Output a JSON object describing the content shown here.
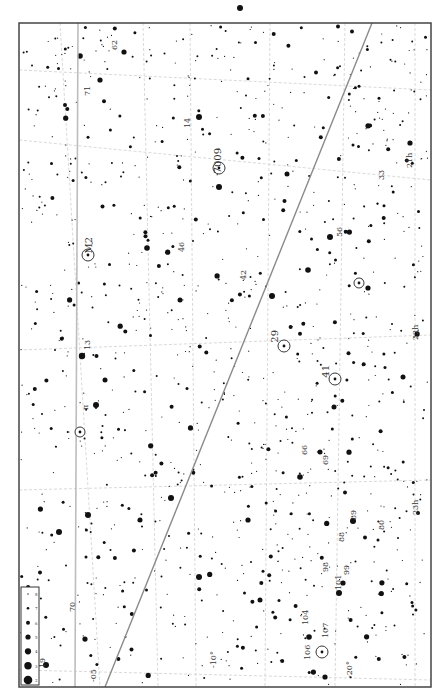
{
  "chart": {
    "frame": {
      "x": 19,
      "y": 23,
      "w": 412,
      "h": 664,
      "stroke": "#444"
    },
    "background": "#ffffff",
    "star_color": "#111111",
    "grid_color": "#cfcfcf",
    "line_color": "#8a8a8a",
    "label_color": "#444444",
    "star_seed": 7,
    "star_count": 1100
  },
  "legend": {
    "box": {
      "x": 21,
      "y": 587,
      "w": 18,
      "h": 98
    },
    "magnitudes": [
      {
        "r": 0.7,
        "label": "8"
      },
      {
        "r": 1.3,
        "label": "7"
      },
      {
        "r": 2.0,
        "label": "6"
      },
      {
        "r": 2.6,
        "label": "5"
      },
      {
        "r": 3.1,
        "label": "4"
      },
      {
        "r": 3.7,
        "label": "3"
      },
      {
        "r": 4.3,
        "label": "2"
      }
    ]
  },
  "grid": {
    "ra_lines": [
      {
        "x1": 60,
        "y1": 23,
        "x2": 100,
        "y2": 687
      },
      {
        "x1": 143,
        "y1": 23,
        "x2": 158,
        "y2": 687
      },
      {
        "x1": 190,
        "y1": 23,
        "x2": 196,
        "y2": 687
      },
      {
        "x1": 270,
        "y1": 23,
        "x2": 265,
        "y2": 687
      },
      {
        "x1": 345,
        "y1": 23,
        "x2": 335,
        "y2": 687
      },
      {
        "x1": 415,
        "y1": 23,
        "x2": 415,
        "y2": 687
      }
    ],
    "dec_lines": [
      {
        "x1": 19,
        "y1": 70,
        "x2": 431,
        "y2": 90
      },
      {
        "x1": 19,
        "y1": 140,
        "x2": 431,
        "y2": 180
      },
      {
        "x1": 19,
        "y1": 350,
        "x2": 431,
        "y2": 335
      },
      {
        "x1": 19,
        "y1": 490,
        "x2": 431,
        "y2": 480
      },
      {
        "x1": 19,
        "y1": 670,
        "x2": 431,
        "y2": 680
      }
    ]
  },
  "lines": {
    "ecliptic": {
      "x1": 105,
      "y1": 687,
      "x2": 372,
      "y2": 23
    },
    "celestial_equator": {
      "x1": 78,
      "y1": 23,
      "x2": 75,
      "y2": 687
    }
  },
  "deep_sky": [
    {
      "name": "M2",
      "x": 88,
      "y": 255,
      "r": 6,
      "label_dx": 4,
      "label_dy": -18
    },
    {
      "name": "7009",
      "x": 219,
      "y": 168,
      "r": 6,
      "label_dx": 2,
      "label_dy": -20
    },
    {
      "name": "29",
      "x": 284,
      "y": 346,
      "r": 6,
      "label_dx": -6,
      "label_dy": -16
    },
    {
      "name": "41",
      "x": 335,
      "y": 379,
      "r": 6,
      "label_dx": -6,
      "label_dy": -14
    },
    {
      "name": "",
      "x": 80,
      "y": 432,
      "r": 5,
      "label_dx": 0,
      "label_dy": 0
    },
    {
      "name": "",
      "x": 322,
      "y": 652,
      "r": 6,
      "label_dx": 0,
      "label_dy": 0
    },
    {
      "name": "",
      "x": 359,
      "y": 283,
      "r": 5,
      "label_dx": 0,
      "label_dy": 0
    }
  ],
  "labels": [
    {
      "text": "19",
      "x": 45,
      "y": 668
    },
    {
      "text": "-05",
      "x": 96,
      "y": 682
    },
    {
      "text": "-10°",
      "x": 216,
      "y": 668
    },
    {
      "text": "-20°",
      "x": 352,
      "y": 678
    },
    {
      "text": "107",
      "x": 328,
      "y": 638
    },
    {
      "text": "106",
      "x": 310,
      "y": 660
    },
    {
      "text": "104",
      "x": 308,
      "y": 625
    },
    {
      "text": "101",
      "x": 341,
      "y": 590
    },
    {
      "text": "99",
      "x": 349,
      "y": 575
    },
    {
      "text": "98",
      "x": 328,
      "y": 572
    },
    {
      "text": "88",
      "x": 344,
      "y": 542
    },
    {
      "text": "89",
      "x": 356,
      "y": 520
    },
    {
      "text": "69",
      "x": 328,
      "y": 465
    },
    {
      "text": "66",
      "x": 307,
      "y": 455
    },
    {
      "text": "80",
      "x": 384,
      "y": 530
    },
    {
      "text": "23h",
      "x": 418,
      "y": 515
    },
    {
      "text": "22h",
      "x": 418,
      "y": 340
    },
    {
      "text": "21h",
      "x": 412,
      "y": 168
    },
    {
      "text": "56",
      "x": 342,
      "y": 237
    },
    {
      "text": "33",
      "x": 384,
      "y": 180
    },
    {
      "text": "42",
      "x": 246,
      "y": 280
    },
    {
      "text": "46",
      "x": 184,
      "y": 252
    },
    {
      "text": "14",
      "x": 190,
      "y": 128
    },
    {
      "text": "62",
      "x": 117,
      "y": 50
    },
    {
      "text": "71",
      "x": 90,
      "y": 96
    },
    {
      "text": "13",
      "x": 90,
      "y": 350
    },
    {
      "text": "π",
      "x": 88,
      "y": 410
    },
    {
      "text": "70",
      "x": 75,
      "y": 612
    }
  ],
  "bright_stars": [
    {
      "x": 80,
      "y": 432,
      "r": 3.5
    },
    {
      "x": 96,
      "y": 405,
      "r": 3
    },
    {
      "x": 105,
      "y": 380,
      "r": 2.5
    },
    {
      "x": 82,
      "y": 356,
      "r": 3.2
    },
    {
      "x": 147,
      "y": 248,
      "r": 2.8
    },
    {
      "x": 272,
      "y": 296,
      "r": 3
    },
    {
      "x": 219,
      "y": 187,
      "r": 3
    },
    {
      "x": 240,
      "y": 8,
      "r": 3
    },
    {
      "x": 335,
      "y": 379,
      "r": 3
    },
    {
      "x": 308,
      "y": 270,
      "r": 2.8
    },
    {
      "x": 330,
      "y": 237,
      "r": 3
    },
    {
      "x": 171,
      "y": 498,
      "r": 3
    },
    {
      "x": 199,
      "y": 577,
      "r": 3
    },
    {
      "x": 88,
      "y": 515,
      "r": 3
    },
    {
      "x": 59,
      "y": 532,
      "r": 3
    },
    {
      "x": 100,
      "y": 80,
      "r": 2.6
    },
    {
      "x": 80,
      "y": 56,
      "r": 2.8
    },
    {
      "x": 124,
      "y": 52,
      "r": 2.6
    },
    {
      "x": 199,
      "y": 117,
      "r": 3
    },
    {
      "x": 287,
      "y": 174,
      "r": 2.5
    },
    {
      "x": 410,
      "y": 143,
      "r": 2.6
    },
    {
      "x": 403,
      "y": 377,
      "r": 2.5
    },
    {
      "x": 334,
      "y": 407,
      "r": 2.5
    },
    {
      "x": 300,
      "y": 477,
      "r": 2.8
    },
    {
      "x": 320,
      "y": 452,
      "r": 2.5
    },
    {
      "x": 339,
      "y": 593,
      "r": 3
    },
    {
      "x": 343,
      "y": 583,
      "r": 2.6
    },
    {
      "x": 309,
      "y": 637,
      "r": 2.8
    },
    {
      "x": 325,
      "y": 677,
      "r": 2.6
    },
    {
      "x": 353,
      "y": 521,
      "r": 3
    },
    {
      "x": 140,
      "y": 520,
      "r": 2.5
    },
    {
      "x": 180,
      "y": 300,
      "r": 2.5
    },
    {
      "x": 248,
      "y": 520,
      "r": 2.6
    },
    {
      "x": 368,
      "y": 288,
      "r": 2.6
    },
    {
      "x": 260,
      "y": 600,
      "r": 2.5
    },
    {
      "x": 46,
      "y": 665,
      "r": 3
    }
  ]
}
